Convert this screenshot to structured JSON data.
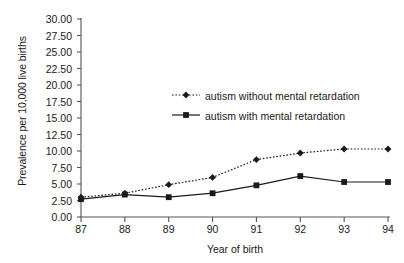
{
  "chart_data": {
    "type": "line",
    "title": "",
    "xlabel": "Year of birth",
    "ylabel": "Prevalence per 10,000 live births",
    "categories": [
      "87",
      "88",
      "89",
      "90",
      "91",
      "92",
      "93",
      "94"
    ],
    "x": [
      87,
      88,
      89,
      90,
      91,
      92,
      93,
      94
    ],
    "xlim": [
      87,
      94
    ],
    "ylim": [
      0,
      30
    ],
    "yticks": [
      "0.00",
      "2.50",
      "5.00",
      "7.50",
      "10.00",
      "12.50",
      "15.00",
      "17.50",
      "20.00",
      "22.50",
      "25.00",
      "27.50",
      "30.00"
    ],
    "ytick_values": [
      0,
      2.5,
      5,
      7.5,
      10,
      12.5,
      15,
      17.5,
      20,
      22.5,
      25,
      27.5,
      30
    ],
    "grid": false,
    "legend_position": "upper-center",
    "series": [
      {
        "name": "autism without mental retardation",
        "marker": "diamond",
        "linestyle": "dotted",
        "color": "#1a1a1a",
        "values": [
          3.0,
          3.6,
          4.9,
          6.0,
          8.7,
          9.7,
          10.3,
          10.3
        ]
      },
      {
        "name": "autism with mental retardation",
        "marker": "square",
        "linestyle": "solid",
        "color": "#1a1a1a",
        "values": [
          2.7,
          3.4,
          3.0,
          3.6,
          4.8,
          6.2,
          5.3,
          5.3
        ]
      }
    ]
  },
  "legend": {
    "items": [
      {
        "label": "autism without mental retardation"
      },
      {
        "label": "autism with mental retardation"
      }
    ]
  },
  "axes": {
    "y_title": "Prevalence per 10,000 live births",
    "x_title": "Year of birth"
  }
}
